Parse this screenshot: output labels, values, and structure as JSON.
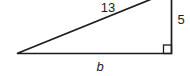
{
  "figure": {
    "labels": {
      "hypotenuse": "13",
      "vertical_side": "5",
      "base": "b"
    },
    "colors": {
      "line": "#1c1c1c",
      "background": "#ffffff"
    }
  }
}
